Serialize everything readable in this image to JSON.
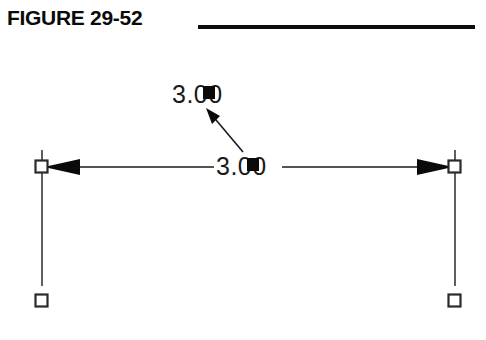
{
  "figure": {
    "title": "FIGURE 29-52",
    "rule_color": "#0d0d0d"
  },
  "drawing": {
    "background_color": "#ffffff",
    "line_color": "#1a1a1a",
    "grip_color": "#0a0a0a",
    "linear_dimension": {
      "value": "3.00",
      "orientation": "horizontal",
      "arrow_style": "filled-closed",
      "left_arrow": "arrow-left-icon",
      "right_arrow": "arrow-right-icon"
    },
    "leader_dimension": {
      "value": "3.00",
      "arrow_style": "filled-closed",
      "arrow": "arrow-upleft-icon"
    },
    "grips": [
      {
        "name": "grip-top-left",
        "state": "unselected",
        "shape": "square-hollow"
      },
      {
        "name": "grip-top-right",
        "state": "unselected",
        "shape": "square-hollow"
      },
      {
        "name": "grip-bottom-left",
        "state": "unselected",
        "shape": "square-hollow"
      },
      {
        "name": "grip-bottom-right",
        "state": "unselected",
        "shape": "square-hollow"
      },
      {
        "name": "grip-text-leader",
        "state": "selected",
        "shape": "square-filled"
      },
      {
        "name": "grip-text-linear",
        "state": "selected",
        "shape": "square-filled"
      }
    ]
  }
}
